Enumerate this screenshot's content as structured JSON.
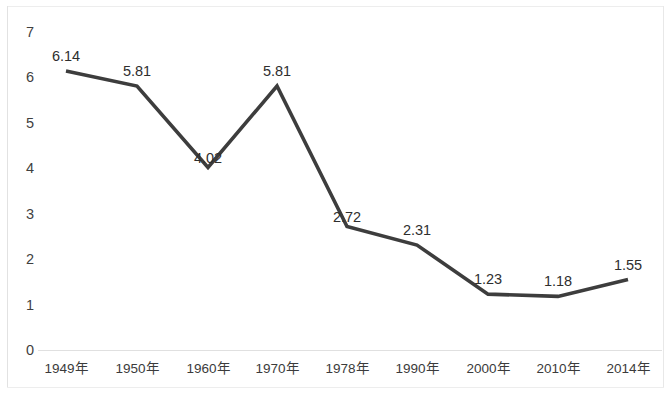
{
  "chart_data": {
    "type": "line",
    "title": "",
    "subtitle": "",
    "xlabel": "",
    "ylabel": "",
    "categories": [
      "1949年",
      "1950年",
      "1960年",
      "1970年",
      "1978年",
      "1990年",
      "2000年",
      "2010年",
      "2014年"
    ],
    "values": [
      6.14,
      5.81,
      4.02,
      5.81,
      2.72,
      2.31,
      1.23,
      1.18,
      1.55
    ],
    "data_labels": [
      "6.14",
      "5.81",
      "4.02",
      "5.81",
      "2.72",
      "2.31",
      "1.23",
      "1.18",
      "1.55"
    ],
    "ylim": [
      0,
      7
    ],
    "ytick_values": [
      7,
      6,
      5,
      4,
      3,
      2,
      1,
      0
    ],
    "ytick_labels": [
      "7",
      "6",
      "5",
      "4",
      "3",
      "2",
      "1",
      "0"
    ],
    "ystep": 1,
    "grid": false,
    "legend": null,
    "legend_position": "none",
    "markers": false,
    "series": [
      {
        "name": "",
        "values": [
          6.14,
          5.81,
          4.02,
          5.81,
          2.72,
          2.31,
          1.23,
          1.18,
          1.55
        ]
      }
    ],
    "colors": {
      "line": "#3d3d3d",
      "axis_text": "#3b3b3b",
      "label_text": "#2e2e2e",
      "frame": "#e2e2e2",
      "background": "#ffffff"
    }
  },
  "geometry": {
    "plot_left": 38,
    "plot_right": 662,
    "y_top_px": 32,
    "y_bottom_px": 350,
    "point_x": [
      66,
      137,
      208,
      277,
      347,
      417,
      488,
      558,
      628
    ],
    "label_offsets_y": [
      -22,
      -22,
      -16,
      -22,
      -16,
      -22,
      -22,
      -22,
      -22
    ],
    "label_offsets_x": [
      0,
      0,
      0,
      0,
      0,
      0,
      0,
      0,
      0
    ]
  }
}
